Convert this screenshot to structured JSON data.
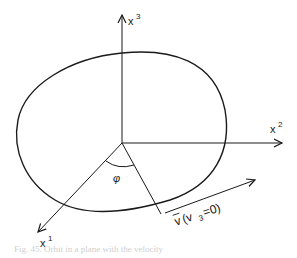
{
  "diagram": {
    "axes": {
      "x1": {
        "label": "x",
        "sup": "1"
      },
      "x2": {
        "label": "x",
        "sup": "2"
      },
      "x3": {
        "label": "x",
        "sup": "3"
      }
    },
    "angle_label": "φ",
    "velocity_label": "v⃗(v₃=0)",
    "velocity_v": "v",
    "velocity_paren": "(v",
    "velocity_sub": "3",
    "velocity_rest": "=0)",
    "caption": "Fig. 45. Orbit in a plane with the velocity"
  },
  "colors": {
    "stroke": "#1a1a1a",
    "background": "#ffffff"
  }
}
